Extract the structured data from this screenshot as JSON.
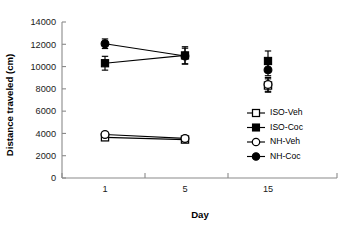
{
  "chart_data": {
    "type": "line",
    "title": "",
    "xlabel": "Day",
    "ylabel": "Distance traveled (cm)",
    "x": [
      1,
      5,
      15
    ],
    "categories": [
      "1",
      "5",
      "15"
    ],
    "xtick_labels": [
      "1",
      "5",
      "15"
    ],
    "ytick_labels": [
      "0",
      "2000",
      "4000",
      "6000",
      "8000",
      "10000",
      "12000",
      "14000"
    ],
    "ytick_values": [
      0,
      2000,
      4000,
      6000,
      8000,
      10000,
      12000,
      14000
    ],
    "ylim": [
      0,
      14000
    ],
    "grid": false,
    "legend_position": "center-right",
    "error_bar_type": "SEM",
    "connect_last_point": false,
    "series": [
      {
        "name": "ISO-Veh",
        "marker": "open-square",
        "values": [
          3650,
          3450,
          8300
        ],
        "errors": [
          210,
          190,
          600
        ]
      },
      {
        "name": "ISO-Coc",
        "marker": "filled-square",
        "values": [
          10300,
          11000,
          10500
        ],
        "errors": [
          620,
          780,
          900
        ]
      },
      {
        "name": "NH-Veh",
        "marker": "open-circle",
        "values": [
          3900,
          3550,
          8400
        ],
        "errors": [
          230,
          200,
          620
        ]
      },
      {
        "name": "NH-Coc",
        "marker": "filled-circle",
        "values": [
          12050,
          10950,
          9700
        ],
        "errors": [
          430,
          700,
          520
        ]
      }
    ],
    "legend_entries": [
      {
        "label": "ISO-Veh",
        "marker": "open-square"
      },
      {
        "label": "ISO-Coc",
        "marker": "filled-square"
      },
      {
        "label": "NH-Veh",
        "marker": "open-circle"
      },
      {
        "label": "NH-Coc",
        "marker": "filled-circle"
      }
    ],
    "colors": {
      "axis": "#8a8a8a",
      "data": "#000000",
      "background": "#ffffff"
    }
  }
}
